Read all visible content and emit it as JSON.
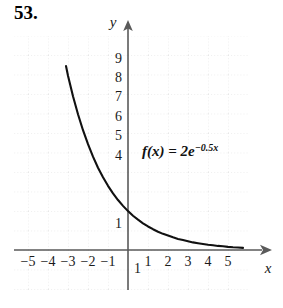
{
  "problem": {
    "number": "53."
  },
  "chart_data": {
    "type": "line",
    "title": "",
    "function_label": {
      "lhs": "f(x) = 2e",
      "exponent": "−0.5x",
      "full": "f(x) = 2e^(-0.5x)"
    },
    "xlabel": "x",
    "ylabel": "y",
    "xlim": [
      -6,
      6
    ],
    "ylim": [
      -1.5,
      10.5
    ],
    "grid": true,
    "legend": "none",
    "x_ticks": [
      "−5",
      "−4",
      "−3",
      "−2",
      "−1",
      "1",
      "2",
      "3",
      "4",
      "5"
    ],
    "x_tick_values": [
      -5,
      -4,
      -3,
      -2,
      -1,
      1,
      2,
      3,
      4,
      5
    ],
    "y_ticks": [
      "9",
      "8",
      "7",
      "6",
      "5",
      "4",
      "1",
      "1"
    ],
    "y_tick_values": [
      9,
      8,
      7,
      6,
      5,
      4,
      1,
      -1
    ],
    "x": [
      -3.1,
      -3.0,
      -2.75,
      -2.5,
      -2.25,
      -2.0,
      -1.75,
      -1.5,
      -1.25,
      -1.0,
      -0.75,
      -0.5,
      -0.25,
      0,
      0.25,
      0.5,
      0.75,
      1.0,
      1.25,
      1.5,
      1.75,
      2.0,
      2.25,
      2.5,
      2.75,
      3.0,
      3.25,
      3.5,
      3.75,
      4.0,
      4.25,
      4.5,
      4.75,
      5.0,
      5.25,
      5.5,
      5.75
    ],
    "values": [
      9.46,
      8.96,
      7.9,
      6.98,
      6.16,
      5.44,
      4.8,
      4.23,
      3.74,
      3.3,
      2.91,
      2.57,
      2.27,
      2.0,
      1.76,
      1.56,
      1.37,
      1.21,
      1.07,
      0.94,
      0.83,
      0.74,
      0.65,
      0.57,
      0.51,
      0.45,
      0.39,
      0.35,
      0.31,
      0.27,
      0.24,
      0.21,
      0.19,
      0.16,
      0.14,
      0.13,
      0.11
    ]
  },
  "colors": {
    "curve": "#111111",
    "axis": "#4a4a4a",
    "grid": "#d8d8d8",
    "text": "#1a1a1a",
    "background": "#ffffff"
  }
}
